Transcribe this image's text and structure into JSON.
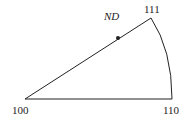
{
  "vertices": {
    "v100": "100",
    "v110": "110",
    "v111": "111"
  },
  "direction_label": "ND",
  "marker": "ND orientation point",
  "colors": {
    "stroke": "#222222",
    "background": "#ffffff"
  }
}
